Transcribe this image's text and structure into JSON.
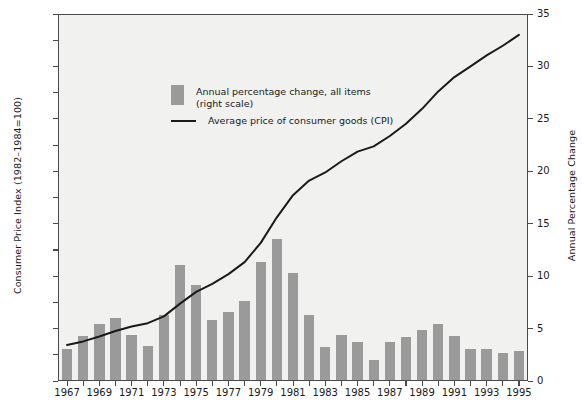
{
  "chart_data": {
    "type": "bar",
    "title": "",
    "subtitle": "",
    "xlabel": "",
    "ylabel": "Consumer Price Index (1982–1984=100)",
    "y2label": "Annual Percentage Change",
    "ylim": [
      20,
      160
    ],
    "y2lim": [
      0,
      35
    ],
    "yticks": [
      20,
      30,
      40,
      50,
      60,
      70,
      80,
      90,
      100,
      110,
      120,
      130,
      140,
      150,
      160
    ],
    "y2ticks": [
      0,
      5,
      10,
      15,
      20,
      25,
      30,
      35
    ],
    "grid": false,
    "legend_position": "upper-left-inside",
    "x": [
      1967,
      1968,
      1969,
      1970,
      1971,
      1972,
      1973,
      1974,
      1975,
      1976,
      1977,
      1978,
      1979,
      1980,
      1981,
      1982,
      1983,
      1984,
      1985,
      1986,
      1987,
      1988,
      1989,
      1990,
      1991,
      1992,
      1993,
      1994,
      1995
    ],
    "xtick_labels": [
      "1967",
      "1969",
      "1971",
      "1973",
      "1975",
      "1977",
      "1979",
      "1981",
      "1983",
      "1985",
      "1987",
      "1989",
      "1991",
      "1993",
      "1995"
    ],
    "xtick_values": [
      1967,
      1969,
      1971,
      1973,
      1975,
      1977,
      1979,
      1981,
      1983,
      1985,
      1987,
      1989,
      1991,
      1993,
      1995
    ],
    "series": [
      {
        "name": "Annual percentage change, all items (right scale)",
        "type": "bar",
        "axis": "right",
        "color": "#9a9a9a",
        "values": [
          3.0,
          4.2,
          5.4,
          5.9,
          4.3,
          3.3,
          6.2,
          11.0,
          9.1,
          5.8,
          6.5,
          7.6,
          11.3,
          13.5,
          10.3,
          6.2,
          3.2,
          4.3,
          3.6,
          1.9,
          3.6,
          4.1,
          4.8,
          5.4,
          4.2,
          3.0,
          3.0,
          2.6,
          2.8
        ]
      },
      {
        "name": "Average price of consumer goods (CPI)",
        "type": "line",
        "axis": "left",
        "color": "#1a1a1a",
        "values": [
          33.4,
          34.8,
          36.7,
          38.8,
          40.5,
          41.8,
          44.4,
          49.3,
          53.8,
          56.9,
          60.6,
          65.2,
          72.6,
          82.4,
          90.9,
          96.5,
          99.6,
          103.9,
          107.6,
          109.6,
          113.6,
          118.3,
          124.0,
          130.7,
          136.2,
          140.3,
          144.5,
          148.2,
          152.4
        ]
      }
    ],
    "legend": [
      {
        "marker": "swatch",
        "label": "Annual percentage change, all items\n(right scale)"
      },
      {
        "marker": "line",
        "label": "Average price of consumer goods (CPI)"
      }
    ],
    "colors": {
      "bar": "#9a9a9a",
      "line": "#1a1a1a",
      "plot_background": "#f1f1ef",
      "axis": "#4a4a4a",
      "text": "#1a1a1a",
      "page_background": "#ffffff"
    }
  }
}
